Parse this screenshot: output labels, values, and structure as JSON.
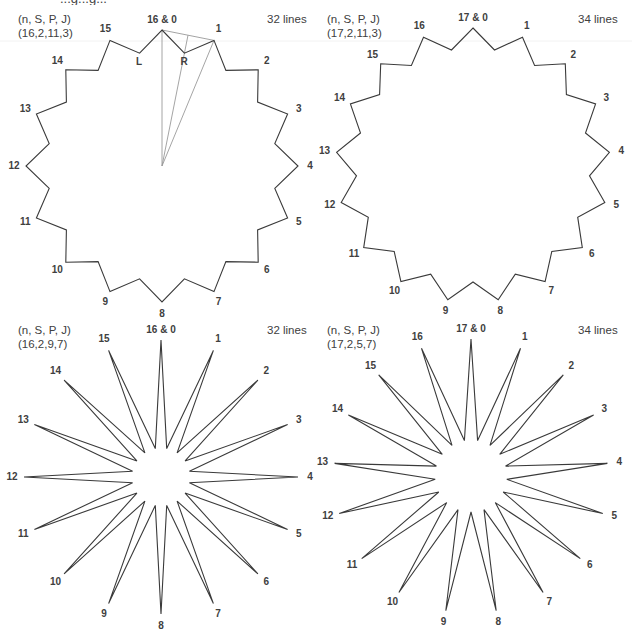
{
  "header": {
    "caption_cut": "...g...g..."
  },
  "panels": [
    {
      "id": "top-left",
      "param_header": "(n, S, P, J)",
      "param_values": "(16,2,11,3)",
      "line_count": "32 lines",
      "n": 16,
      "top_label": "16 & 0",
      "center": [
        162,
        166
      ],
      "outer_radius": 136,
      "inner_radius": 115,
      "style": "polygon",
      "extra_labels": [
        {
          "text": "L",
          "x": 139,
          "y": 65
        },
        {
          "text": "R",
          "x": 184,
          "y": 65
        }
      ],
      "guides": true
    },
    {
      "id": "top-right",
      "param_header": "(n, S, P, J)",
      "param_values": "(17,2,11,3)",
      "line_count": "34 lines",
      "n": 17,
      "top_label": "17 & 0",
      "center": [
        473,
        165
      ],
      "outer_radius": 137,
      "inner_radius": 117,
      "style": "polygon",
      "extra_labels": [],
      "guides": false
    },
    {
      "id": "bottom-left",
      "param_header": "(n, S, P, J)",
      "param_values": "(16,2,9,7)",
      "line_count": "32 lines",
      "n": 16,
      "top_label": "16 & 0",
      "center": [
        161,
        477
      ],
      "outer_radius": 137,
      "inner_radius": 29,
      "style": "star",
      "extra_labels": [],
      "guides": false
    },
    {
      "id": "bottom-right",
      "param_header": "(n, S, P, J)",
      "param_values": "(17,2,5,7)",
      "line_count": "34 lines",
      "n": 17,
      "top_label": "17 & 0",
      "center": [
        471,
        476
      ],
      "outer_radius": 137,
      "inner_radius": 36,
      "style": "star",
      "extra_labels": [],
      "guides": false
    }
  ],
  "layout": {
    "panel_text": [
      {
        "header_xy": [
          18,
          23
        ],
        "values_xy": [
          18,
          37
        ],
        "lines_xy": [
          267,
          23
        ]
      },
      {
        "header_xy": [
          327,
          23
        ],
        "values_xy": [
          327,
          37
        ],
        "lines_xy": [
          578,
          23
        ]
      },
      {
        "header_xy": [
          18,
          334
        ],
        "values_xy": [
          18,
          348
        ],
        "lines_xy": [
          267,
          334
        ]
      },
      {
        "header_xy": [
          327,
          334
        ],
        "values_xy": [
          327,
          348
        ],
        "lines_xy": [
          578,
          334
        ]
      }
    ]
  }
}
